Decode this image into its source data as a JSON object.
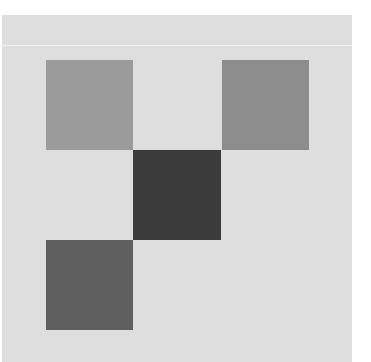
{
  "canvas": {
    "background": "#ffffff",
    "panel_color": "#dedede",
    "divider_color": "#f4f4f4"
  },
  "tiles": [
    {
      "name": "tile-top-left",
      "color": "#9b9b9b",
      "x": 46,
      "y": 60,
      "w": 87,
      "h": 90
    },
    {
      "name": "tile-top-right",
      "color": "#8d8d8d",
      "x": 222,
      "y": 60,
      "w": 87,
      "h": 90
    },
    {
      "name": "tile-center",
      "color": "#3b3b3b",
      "x": 133,
      "y": 150,
      "w": 88,
      "h": 90
    },
    {
      "name": "tile-bottom-left",
      "color": "#5f5f5f",
      "x": 46,
      "y": 240,
      "w": 87,
      "h": 90
    }
  ]
}
